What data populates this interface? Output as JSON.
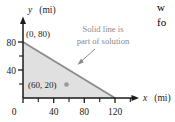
{
  "figure": {
    "background_color": "#ffffff",
    "axes": {
      "x": {
        "label": "x",
        "unit": "(mi)",
        "ticks": [
          "0",
          "40",
          "80",
          "120"
        ],
        "tick_values": [
          0,
          40,
          80,
          120
        ],
        "minor_ticks": [
          20,
          60,
          100,
          140
        ],
        "range": [
          0,
          150
        ]
      },
      "y": {
        "label": "y",
        "unit": "(mi)",
        "ticks": [
          "40",
          "80"
        ],
        "tick_values": [
          40,
          80
        ],
        "minor_ticks": [
          20,
          60
        ],
        "range": [
          0,
          95
        ]
      },
      "axis_color": "#1a1a1a"
    },
    "region": {
      "name": "solution-region",
      "fill_color": "#e0e0e0",
      "vertices": [
        [
          0,
          0
        ],
        [
          0,
          80
        ],
        [
          120,
          0
        ]
      ],
      "boundary_color": "#8c8c8c",
      "boundary_style": "solid"
    },
    "intercept_label": "(0, 80)",
    "intercept_point": [
      0,
      80
    ],
    "marked_point": {
      "label": "(60, 20)",
      "coordinates": [
        60,
        20
      ],
      "marker_color": "#9a9a9a"
    },
    "annotation": {
      "line1": "Solid line is",
      "line2": "part of solution",
      "color": "#8a8a8a",
      "arrow_color": "#8a8a8a"
    }
  },
  "page_edge_text": {
    "line1": "w",
    "line2": "fo"
  }
}
